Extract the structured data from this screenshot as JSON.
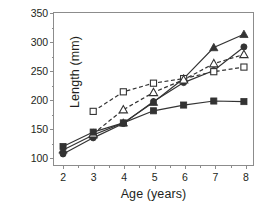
{
  "chart_data": {
    "type": "line",
    "title": "",
    "xlabel": "Age (years)",
    "ylabel": "Length (mm)",
    "x": [
      2,
      3,
      4,
      5,
      6,
      7,
      8
    ],
    "xlim": [
      1.7,
      8.3
    ],
    "ylim": [
      85,
      350
    ],
    "xticks": [
      2,
      3,
      4,
      5,
      6,
      7,
      8
    ],
    "yticks": [
      100,
      150,
      200,
      250,
      300,
      350
    ],
    "yticks_minor": [
      125,
      175,
      225,
      275,
      325
    ],
    "xticks_minor": [
      2.5,
      3.5,
      4.5,
      5.5,
      6.5,
      7.5
    ],
    "grid": false,
    "legend": "none",
    "series": [
      {
        "name": "filled-triangle",
        "marker": "triangle-filled",
        "line": "solid",
        "color": "#333333",
        "x": [
          2,
          3,
          4,
          5,
          6,
          7,
          8
        ],
        "values": [
          112,
          138,
          159,
          195,
          236,
          290,
          313
        ]
      },
      {
        "name": "filled-circle",
        "marker": "circle-filled",
        "line": "solid",
        "color": "#333333",
        "x": [
          2,
          3,
          4,
          5,
          6,
          7,
          8
        ],
        "values": [
          105,
          133,
          158,
          196,
          229,
          250,
          291
        ]
      },
      {
        "name": "open-square",
        "marker": "square-open",
        "line": "dashed",
        "color": "#333333",
        "x": [
          3,
          4,
          5,
          6,
          7,
          8
        ],
        "values": [
          179,
          213,
          228,
          236,
          248,
          256
        ]
      },
      {
        "name": "open-triangle",
        "marker": "triangle-open",
        "line": "dashed",
        "color": "#333333",
        "x": [
          3,
          4,
          5,
          6,
          7,
          8
        ],
        "values": [
          140,
          182,
          212,
          234,
          262,
          278
        ]
      },
      {
        "name": "filled-square",
        "marker": "square-filled",
        "line": "solid",
        "color": "#333333",
        "x": [
          2,
          3,
          4,
          5,
          6,
          7,
          8
        ],
        "values": [
          118,
          143,
          159,
          180,
          190,
          197,
          196
        ]
      }
    ]
  }
}
